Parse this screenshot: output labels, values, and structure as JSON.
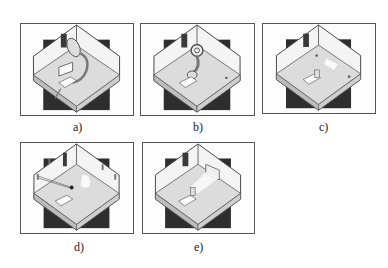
{
  "figure": {
    "panels": [
      {
        "id": "a",
        "caption": "a)",
        "scene": "room-with-satellite-dish-and-cable-to-chair"
      },
      {
        "id": "b",
        "caption": "b)",
        "scene": "room-with-cable-coil-and-wire-to-chair"
      },
      {
        "id": "c",
        "caption": "c)",
        "scene": "room-with-chair-and-floor-sensors"
      },
      {
        "id": "d",
        "caption": "d)",
        "scene": "room-with-beams-from-wall-sensors-to-chair"
      },
      {
        "id": "e",
        "caption": "e)",
        "scene": "room-with-light-beam-from-wall-panel-to-chair"
      }
    ]
  },
  "colors": {
    "frame": "#555555",
    "dark_square": "#2e2e2e",
    "wall": "#f4f4f4",
    "floor": "#dcdcdc",
    "base_side": "#bdbdbd",
    "outline": "#444444"
  }
}
